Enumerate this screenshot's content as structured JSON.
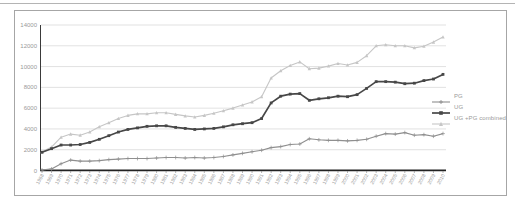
{
  "figure": {
    "frame_border_color": "#a6a6a6",
    "background_color": "#ffffff",
    "top_rule_color": "#b4b4b4"
  },
  "chart_data": {
    "type": "line",
    "title": "",
    "xlabel": "",
    "ylabel": "",
    "x": [
      1968,
      1969,
      1970,
      1971,
      1972,
      1973,
      1974,
      1975,
      1976,
      1977,
      1978,
      1979,
      1980,
      1981,
      1982,
      1983,
      1984,
      1985,
      1986,
      1987,
      1988,
      1989,
      1990,
      1991,
      1992,
      1993,
      1994,
      1995,
      1996,
      1997,
      1998,
      1999,
      2000,
      2001,
      2002,
      2003,
      2004,
      2005,
      2006,
      2007,
      2008,
      2009,
      2010
    ],
    "ylim": [
      0,
      14000
    ],
    "yticks": [
      0,
      2000,
      4000,
      6000,
      8000,
      10000,
      12000,
      14000
    ],
    "grid": true,
    "legend_position": "right",
    "series": [
      {
        "name": "PG",
        "color": "#8f8f8f",
        "marker": "plus",
        "line_width": 1.1,
        "values": [
          50,
          150,
          650,
          1000,
          900,
          900,
          950,
          1050,
          1100,
          1150,
          1150,
          1150,
          1200,
          1250,
          1250,
          1200,
          1250,
          1200,
          1250,
          1350,
          1500,
          1650,
          1800,
          1950,
          2200,
          2300,
          2500,
          2550,
          3050,
          2950,
          2900,
          2900,
          2850,
          2900,
          3000,
          3300,
          3550,
          3500,
          3650,
          3400,
          3450,
          3300,
          3550
        ]
      },
      {
        "name": "UG",
        "color": "#474747",
        "marker": "square",
        "line_width": 1.7,
        "values": [
          1750,
          2100,
          2450,
          2450,
          2500,
          2700,
          3000,
          3350,
          3700,
          3950,
          4100,
          4250,
          4300,
          4300,
          4150,
          4050,
          3950,
          4000,
          4050,
          4200,
          4400,
          4500,
          4600,
          5000,
          6500,
          7150,
          7350,
          7400,
          6750,
          6900,
          7000,
          7150,
          7100,
          7300,
          7900,
          8550,
          8550,
          8500,
          8350,
          8400,
          8650,
          8800,
          9250
        ]
      },
      {
        "name": "UG +PG combined",
        "color": "#c6c6c6",
        "marker": "triangle",
        "line_width": 1.1,
        "values": [
          1800,
          2250,
          3200,
          3500,
          3400,
          3700,
          4200,
          4600,
          5000,
          5300,
          5450,
          5450,
          5550,
          5550,
          5400,
          5250,
          5150,
          5300,
          5500,
          5750,
          6000,
          6300,
          6600,
          7100,
          8900,
          9600,
          10100,
          10450,
          9800,
          9850,
          10050,
          10300,
          10150,
          10400,
          11050,
          12000,
          12100,
          12000,
          12000,
          11800,
          11950,
          12350,
          12850
        ]
      }
    ],
    "axis_color": "#222222",
    "y_axis_color": "#3a3a3a",
    "grid_color": "#d9d9d9",
    "tick_color": "#666666",
    "tick_label_color": "#9a9a9a"
  }
}
